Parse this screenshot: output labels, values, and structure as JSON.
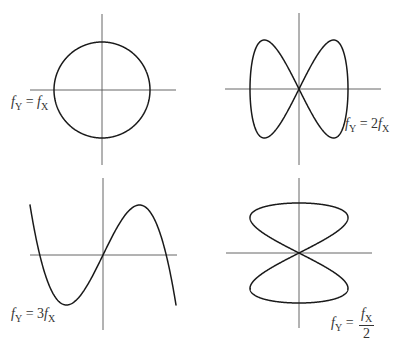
{
  "title": {
    "text": "",
    "clipped": true
  },
  "chart_data": {
    "type": "line",
    "panels": [
      {
        "id": "ratio-1-1",
        "label": "fY = fX",
        "ratio": "1:1",
        "shape": "circle",
        "parametric": {
          "x": "sin(t)",
          "y": "cos(t)"
        },
        "center": [
          102,
          90
        ],
        "amp_x": 48,
        "amp_y": 48,
        "freq_x": 1,
        "freq_y": 1,
        "phase_y": 1.5708,
        "axes": {
          "h": [
            30,
            176
          ],
          "v": [
            14,
            165
          ]
        }
      },
      {
        "id": "ratio-2-1",
        "label": "fY = 2fX",
        "ratio": "2:1",
        "shape": "two lobes side-by-side",
        "parametric": {
          "x": "sin(t)",
          "y": "sin(2t)"
        },
        "center": [
          299,
          89
        ],
        "amp_x": 49,
        "amp_y": 49,
        "freq_x": 1,
        "freq_y": 2,
        "phase_y": 0,
        "axes": {
          "h": [
            225,
            381
          ],
          "v": [
            13,
            165
          ]
        }
      },
      {
        "id": "ratio-3-1",
        "label": "fY = 3fX",
        "ratio": "3:1",
        "shape": "three lobes side-by-side",
        "parametric": {
          "x": "sin(t)",
          "y": "sin(3t)"
        },
        "center": [
          103,
          255
        ],
        "amp_x": 73,
        "amp_y": 50,
        "freq_x": 1,
        "freq_y": 3,
        "phase_y": 0,
        "axes": {
          "h": [
            30,
            177
          ],
          "v": [
            178,
            330
          ]
        }
      },
      {
        "id": "ratio-1-2",
        "label": "fY = fX/2",
        "ratio": "1:2",
        "shape": "two lobes stacked vertically",
        "parametric": {
          "x": "sin(2t)",
          "y": "sin(t)"
        },
        "center": [
          299,
          253
        ],
        "amp_x": 49,
        "amp_y": 50,
        "freq_x": 2,
        "freq_y": 1,
        "phase_y": 0,
        "axes": {
          "h": [
            226,
            372
          ],
          "v": [
            178,
            328
          ]
        }
      }
    ]
  },
  "labels": {
    "l1": {
      "f": "f",
      "sub_y": "Y",
      "eq": " = ",
      "f2": "f",
      "sub_x": "X"
    },
    "l2": {
      "f": "f",
      "sub_y": "Y",
      "eq": " = 2",
      "f2": "f",
      "sub_x": "X"
    },
    "l3": {
      "f": "f",
      "sub_y": "Y",
      "eq": " = 3",
      "f2": "f",
      "sub_x": "X"
    },
    "l4": {
      "f": "f",
      "sub_y": "Y",
      "eq": " = ",
      "num_f": "f",
      "num_sub": "X",
      "den": "2"
    }
  }
}
